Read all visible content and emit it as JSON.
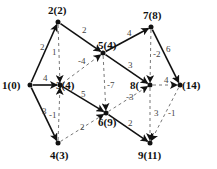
{
  "diagram": {
    "type": "directed-graph",
    "nodes": [
      {
        "id": "1",
        "label": "1(0)",
        "x": 30,
        "y": 85,
        "lx": 2,
        "ly": 89
      },
      {
        "id": "2",
        "label": "2(2)",
        "x": 58,
        "y": 22,
        "lx": 48,
        "ly": 14
      },
      {
        "id": "3",
        "label": "3(4)",
        "x": 60,
        "y": 85,
        "lx": 56,
        "ly": 89
      },
      {
        "id": "4",
        "label": "4(3)",
        "x": 58,
        "y": 143,
        "lx": 50,
        "ly": 159
      },
      {
        "id": "5",
        "label": "5(4)",
        "x": 103,
        "y": 53,
        "lx": 98,
        "ly": 49
      },
      {
        "id": "6",
        "label": "6(9)",
        "x": 106,
        "y": 113,
        "lx": 98,
        "ly": 126
      },
      {
        "id": "7",
        "label": "7(8)",
        "x": 151,
        "y": 27,
        "lx": 143,
        "ly": 19
      },
      {
        "id": "8",
        "label": "8(",
        "x": 150,
        "y": 85,
        "lx": 130,
        "ly": 89
      },
      {
        "id": "9",
        "label": "9(11)",
        "x": 150,
        "y": 143,
        "lx": 138,
        "ly": 159
      },
      {
        "id": "10",
        "label": "(14)",
        "x": 180,
        "y": 85,
        "lx": 182,
        "ly": 89
      }
    ],
    "edges": [
      {
        "from": "1",
        "to": "2",
        "label": "2",
        "style": "solid",
        "lx": 40,
        "ly": 50
      },
      {
        "from": "1",
        "to": "3",
        "label": "4",
        "style": "solid",
        "lx": 43,
        "ly": 81
      },
      {
        "from": "1",
        "to": "4",
        "label": "3",
        "style": "solid",
        "lx": 42,
        "ly": 114
      },
      {
        "from": "2",
        "to": "3",
        "label": "1",
        "style": "dashed",
        "lx": 52,
        "ly": 55
      },
      {
        "from": "2",
        "to": "5",
        "label": "2",
        "style": "solid",
        "lx": 82,
        "ly": 33
      },
      {
        "from": "3",
        "to": "5",
        "label": "-4",
        "style": "dashed",
        "lx": 78,
        "ly": 64
      },
      {
        "from": "4",
        "to": "3",
        "label": "-1",
        "style": "dashed",
        "lx": 49,
        "ly": 118
      },
      {
        "from": "3",
        "to": "6",
        "label": "5",
        "style": "solid",
        "lx": 81,
        "ly": 97
      },
      {
        "from": "4",
        "to": "6",
        "label": "2",
        "style": "dashed",
        "lx": 80,
        "ly": 130
      },
      {
        "from": "5",
        "to": "7",
        "label": "4",
        "style": "solid",
        "lx": 127,
        "ly": 36
      },
      {
        "from": "5",
        "to": "8",
        "label": "3",
        "style": "solid",
        "lx": 128,
        "ly": 68
      },
      {
        "from": "5",
        "to": "6",
        "label": "-7",
        "style": "dashed",
        "lx": 107,
        "ly": 88
      },
      {
        "from": "7",
        "to": "8",
        "label": "-2",
        "style": "dashed",
        "lx": 153,
        "ly": 57
      },
      {
        "from": "7",
        "to": "10",
        "label": "6",
        "style": "solid",
        "lx": 166,
        "ly": 52
      },
      {
        "from": "6",
        "to": "8",
        "label": "-3",
        "style": "dashed",
        "lx": 126,
        "ly": 100
      },
      {
        "from": "8",
        "to": "10",
        "label": "4",
        "style": "dashed",
        "lx": 164,
        "ly": 83
      },
      {
        "from": "8",
        "to": "9",
        "label": "3",
        "style": "dashed",
        "lx": 154,
        "ly": 116
      },
      {
        "from": "6",
        "to": "9",
        "label": "2",
        "style": "solid",
        "lx": 128,
        "ly": 126
      },
      {
        "from": "10",
        "to": "9",
        "label": "-1",
        "style": "dashed",
        "lx": 168,
        "ly": 116
      }
    ]
  }
}
